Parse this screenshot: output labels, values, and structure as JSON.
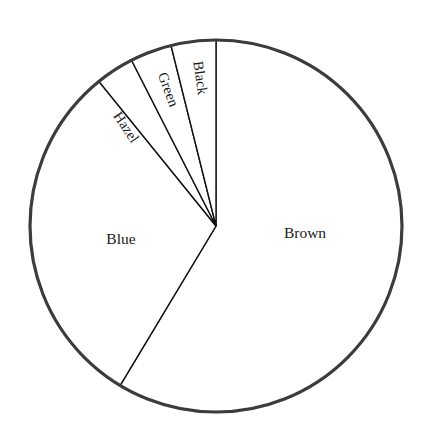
{
  "chart_data": {
    "type": "pie",
    "title": "",
    "subtitle": "",
    "xlabel": "",
    "ylabel": "",
    "legend": "none",
    "grid": false,
    "start_angle_deg": 0,
    "direction": "clockwise",
    "center": {
      "x": 216,
      "y": 226
    },
    "radius": 186,
    "categories": [
      "Brown",
      "Blue",
      "Hazel",
      "Green",
      "Black"
    ],
    "values": [
      58.6,
      30.6,
      7.4,
      3.6,
      3.9
    ],
    "units": "percent",
    "slices": [
      {
        "label": "Brown",
        "value": 58.6,
        "angle_deg": 211.0,
        "start_deg": 0.0,
        "end_deg": 211.0,
        "label_rotation_deg": 0,
        "label_x": 305,
        "label_y": 234,
        "fill": "#ffffff",
        "stroke": "#111111"
      },
      {
        "label": "Blue",
        "value": 30.6,
        "angle_deg": 110.0,
        "start_deg": 211.0,
        "end_deg": 321.0,
        "label_rotation_deg": 0,
        "label_x": 121,
        "label_y": 240,
        "fill": "#ffffff",
        "stroke": "#111111"
      },
      {
        "label": "Hazel",
        "value": 7.4,
        "angle_deg": 12.0,
        "start_deg": 321.0,
        "end_deg": 333.0,
        "label_rotation_deg": 56,
        "label_x": 125,
        "label_y": 128,
        "fill": "#ffffff",
        "stroke": "#111111"
      },
      {
        "label": "Green",
        "value": 3.6,
        "angle_deg": 13.0,
        "start_deg": 333.0,
        "end_deg": 346.0,
        "label_rotation_deg": 70,
        "label_x": 167,
        "label_y": 90,
        "fill": "#ffffff",
        "stroke": "#111111"
      },
      {
        "label": "Black",
        "value": 3.9,
        "angle_deg": 14.0,
        "start_deg": 346.0,
        "end_deg": 360.0,
        "label_rotation_deg": 82,
        "label_x": 199,
        "label_y": 78,
        "fill": "#ffffff",
        "stroke": "#111111"
      }
    ],
    "colors": {
      "background": "#ffffff",
      "outline": "#3c3c3c",
      "divider": "#111111",
      "text": "#1a1a1a"
    }
  },
  "labels": {
    "brown": "Brown",
    "blue": "Blue",
    "hazel": "Hazel",
    "green": "Green",
    "black": "Black"
  }
}
